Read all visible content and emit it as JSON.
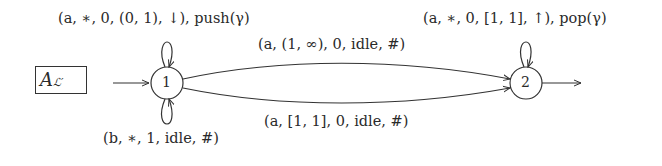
{
  "automaton": {
    "name": "A",
    "name_subscript": "ℒ′",
    "states": [
      {
        "id": "1",
        "label": "1",
        "initial": true,
        "final": false
      },
      {
        "id": "2",
        "label": "2",
        "initial": false,
        "final": true
      }
    ],
    "transitions": [
      {
        "from": "1",
        "to": "1",
        "position": "loop-top",
        "label": "(a, ∗, 0, (0, 1), ↓), push(γ)"
      },
      {
        "from": "1",
        "to": "1",
        "position": "loop-bottom",
        "label": "(b, ∗, 1, idle, #)"
      },
      {
        "from": "1",
        "to": "2",
        "position": "upper-arc",
        "label": "(a, (1, ∞), 0, idle, #)"
      },
      {
        "from": "1",
        "to": "2",
        "position": "lower-arc",
        "label": "(a, [1, 1], 0, idle, #)"
      },
      {
        "from": "2",
        "to": "2",
        "position": "loop-top",
        "label": "(a, ∗, 0, [1, 1], ↑), pop(γ)"
      }
    ]
  }
}
